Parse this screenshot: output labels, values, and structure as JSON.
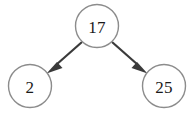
{
  "diagram": {
    "type": "binary-tree",
    "background_color": "#ffffff",
    "node_stroke_color": "#8c8c8c",
    "node_fill_color": "#ffffff",
    "edge_color": "#3a3a3a",
    "label_color": "#1a1a1a",
    "nodes": [
      {
        "id": "root",
        "label": "17",
        "cx": 97,
        "cy": 26,
        "r": 21.5
      },
      {
        "id": "left",
        "label": "2",
        "cx": 30,
        "cy": 86,
        "r": 21.5
      },
      {
        "id": "right",
        "label": "25",
        "cx": 164,
        "cy": 86,
        "r": 21.5
      }
    ],
    "edges": [
      {
        "from": "root",
        "to": "left",
        "direction": "down-left",
        "arrow": true
      },
      {
        "from": "root",
        "to": "right",
        "direction": "down-right",
        "arrow": true
      }
    ]
  }
}
